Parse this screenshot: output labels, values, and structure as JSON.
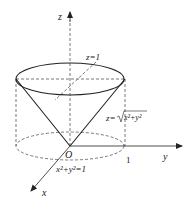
{
  "diagram": {
    "axes": {
      "z_label": "z",
      "y_label": "y",
      "x_label": "x",
      "origin_label": "O"
    },
    "labels": {
      "plane": "z=1",
      "cone_prefix": "z=",
      "cone_radicand": "x²+y²",
      "cylinder": "x²+y²=1",
      "unit_tick": "1"
    },
    "colors": {
      "stroke": "#222222",
      "dashed": "#555555",
      "background": "#ffffff"
    }
  }
}
